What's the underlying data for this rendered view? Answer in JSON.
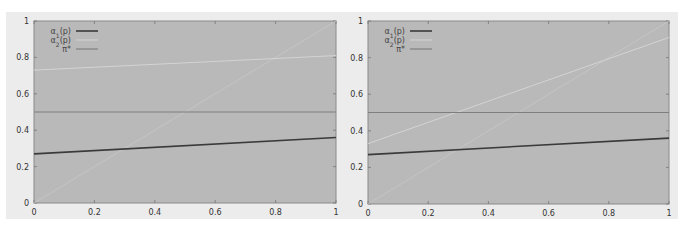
{
  "chart_data": [
    {
      "type": "line",
      "title": "",
      "xlabel": "",
      "ylabel": "",
      "xlim": [
        0,
        1
      ],
      "ylim": [
        0,
        1
      ],
      "grid": false,
      "legend_position": "top-left",
      "x_ticks": [
        "0",
        "0.2",
        "0.4",
        "0.6",
        "0.8",
        "1"
      ],
      "y_ticks": [
        "0",
        "0.2",
        "0.4",
        "0.6",
        "0.8",
        "1"
      ],
      "x": [
        0,
        1
      ],
      "series": [
        {
          "name": "α1(p)",
          "color": "#3a3a3a",
          "values": [
            0.27,
            0.36
          ]
        },
        {
          "name": "α2(p)",
          "color": "#d4d4d4",
          "values": [
            0.73,
            0.81
          ]
        },
        {
          "name": "π*",
          "color": "#7e7e7e",
          "values": [
            0.5,
            0.5
          ]
        },
        {
          "name": "",
          "color": "#c8c8c8",
          "values": [
            0,
            1
          ]
        }
      ]
    },
    {
      "type": "line",
      "title": "",
      "xlabel": "",
      "ylabel": "",
      "xlim": [
        0,
        1
      ],
      "ylim": [
        0,
        1
      ],
      "grid": false,
      "legend_position": "top-left",
      "x_ticks": [
        "0",
        "0.2",
        "0.4",
        "0.6",
        "0.8",
        "1"
      ],
      "y_ticks": [
        "0",
        "0.2",
        "0.4",
        "0.6",
        "0.8",
        "1"
      ],
      "x": [
        0,
        1
      ],
      "series": [
        {
          "name": "α1(p)",
          "color": "#3a3a3a",
          "values": [
            0.27,
            0.36
          ]
        },
        {
          "name": "α2(p)",
          "color": "#d4d4d4",
          "values": [
            0.33,
            0.91
          ]
        },
        {
          "name": "π*",
          "color": "#7e7e7e",
          "values": [
            0.5,
            0.5
          ]
        },
        {
          "name": "",
          "color": "#c8c8c8",
          "values": [
            0,
            1
          ]
        }
      ]
    }
  ],
  "legend": {
    "alpha1": "α",
    "alpha1_sub": "1",
    "alpha1_suffix": "(p)",
    "alpha2": "α",
    "alpha2_sub": "2",
    "alpha2_suffix": "(p)",
    "pi_star": "π*"
  },
  "colors": {
    "plot_bg": "#b9b9b9",
    "panel_bg": "#ececec",
    "axis": "#8a8a8a"
  }
}
